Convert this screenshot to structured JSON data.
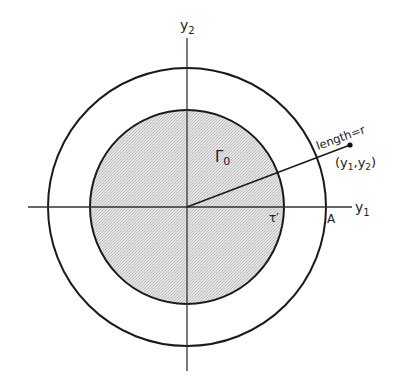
{
  "diagram": {
    "type": "geometric-figure",
    "colors": {
      "stroke": "#1a1a1a",
      "fill_region": "#d6d6d6",
      "background": "#ffffff"
    },
    "axes": {
      "horizontal_label": "y",
      "horizontal_sub": "1",
      "vertical_label": "y",
      "vertical_sub": "2"
    },
    "labels": {
      "region_main": "Γ",
      "region_sub": "0",
      "boundary": "τ′",
      "outer_point": "A",
      "radius_label": "length=r",
      "point_label_open": "(y",
      "point_sub1": "1",
      "point_comma": ",y",
      "point_sub2": "2",
      "point_label_close": ")"
    },
    "geometry": {
      "center": [
        187,
        207
      ],
      "inner_radius": 97,
      "outer_radius": 139,
      "point": [
        350,
        145
      ]
    }
  }
}
